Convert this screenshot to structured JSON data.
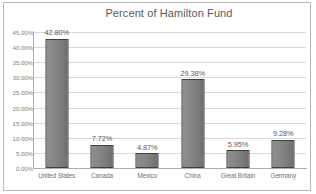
{
  "chart_data": {
    "type": "bar",
    "title": "Percent of Hamilton Fund",
    "xlabel": "",
    "ylabel": "",
    "categories": [
      "United States",
      "Canada",
      "Mexico",
      "China",
      "Great Britain",
      "Germany"
    ],
    "values": [
      42.8,
      7.72,
      4.87,
      29.38,
      5.95,
      9.28
    ],
    "data_labels": [
      "42.80%",
      "7.72%",
      "4.87%",
      "29.38%",
      "5.95%",
      "9.28%"
    ],
    "ylim": [
      0,
      45
    ],
    "ytick_values": [
      0,
      5,
      10,
      15,
      20,
      25,
      30,
      35,
      40,
      45
    ],
    "ytick_labels": [
      "0.00%",
      "5.00%",
      "10.00%",
      "15.00%",
      "20.00%",
      "25.00%",
      "30.00%",
      "35.00%",
      "40.00%",
      "45.00%"
    ],
    "grid": true,
    "grid_axis": "y",
    "legend": false,
    "legend_position": "none",
    "series": [
      {
        "name": "Percent of Hamilton Fund",
        "values": [
          42.8,
          7.72,
          4.87,
          29.38,
          5.95,
          9.28
        ]
      }
    ],
    "colors": {
      "bar_fill": "#808080",
      "bar_border": "#3f3f3f",
      "gridline": "#d9d9d9",
      "axis": "#adadad",
      "title_text": "#595959",
      "tick_text": "#7f7f7f",
      "label_text": "#5a5a5a",
      "frame_border": "#b9b9b9",
      "background": "#ffffff"
    }
  }
}
